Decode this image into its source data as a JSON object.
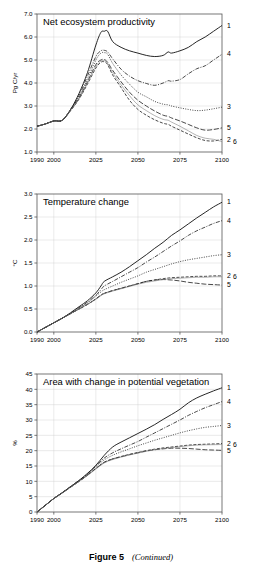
{
  "figure": {
    "caption_label": "Figure 5",
    "caption_note": "(Continued)"
  },
  "axis": {
    "x_ticks": [
      "1990",
      "2000",
      "2025",
      "2050",
      "2075",
      "2100"
    ],
    "x_tick_values": [
      1990,
      2000,
      2025,
      2050,
      2075,
      2100
    ],
    "x_min": 1990,
    "x_max": 2100
  },
  "series_labels": [
    "1",
    "2",
    "3",
    "4",
    "5",
    "6"
  ],
  "chart_data": [
    {
      "type": "line",
      "title": "Net ecosystem productivity",
      "xlabel": "",
      "ylabel": "Pg C/yr",
      "xlim": [
        1990,
        2100
      ],
      "ylim": [
        1.0,
        7.0
      ],
      "grid": true,
      "legend_position": "right-edge-labels",
      "yticks": [
        1.0,
        2.0,
        3.0,
        4.0,
        5.0,
        6.0,
        7.0
      ],
      "ytick_labels": [
        "1.0",
        "2.0",
        "3.0",
        "4.0",
        "5.0",
        "6.0",
        "7.0"
      ],
      "xticks": [
        1990,
        2000,
        2025,
        2050,
        2075,
        2100
      ],
      "xtick_labels": [
        "1990",
        "2000",
        "2025",
        "2050",
        "2075",
        "2100"
      ],
      "x": [
        1990,
        1995,
        2000,
        2005,
        2010,
        2015,
        2020,
        2025,
        2028,
        2030,
        2032,
        2035,
        2040,
        2045,
        2050,
        2055,
        2060,
        2065,
        2068,
        2070,
        2075,
        2080,
        2085,
        2090,
        2095,
        2100
      ],
      "series": [
        {
          "name": "1",
          "label": "1",
          "style": "solid",
          "end_label_value": 6.5,
          "values": [
            2.12,
            2.22,
            2.35,
            2.38,
            2.85,
            3.55,
            4.45,
            5.65,
            6.2,
            6.25,
            6.25,
            5.8,
            5.55,
            5.4,
            5.3,
            5.2,
            5.15,
            5.2,
            5.35,
            5.3,
            5.4,
            5.55,
            5.8,
            6.0,
            6.25,
            6.5
          ]
        },
        {
          "name": "2",
          "label": "2",
          "style": "dashed",
          "end_label_value": 1.55,
          "values": [
            2.12,
            2.22,
            2.35,
            2.38,
            2.8,
            3.3,
            3.95,
            4.65,
            4.9,
            4.92,
            4.8,
            4.35,
            3.8,
            3.25,
            2.85,
            2.6,
            2.4,
            2.25,
            2.2,
            2.12,
            1.95,
            1.78,
            1.62,
            1.5,
            1.48,
            1.55
          ]
        },
        {
          "name": "3",
          "label": "3",
          "style": "dotted",
          "end_label_value": 2.95,
          "values": [
            2.12,
            2.22,
            2.35,
            2.38,
            2.85,
            3.4,
            4.15,
            5.0,
            5.3,
            5.32,
            5.25,
            4.85,
            4.35,
            3.95,
            3.6,
            3.4,
            3.2,
            3.08,
            3.05,
            3.0,
            2.92,
            2.85,
            2.8,
            2.82,
            2.88,
            2.95
          ]
        },
        {
          "name": "4",
          "label": "4",
          "style": "dashdot",
          "end_label_value": 5.25,
          "values": [
            2.12,
            2.22,
            2.35,
            2.38,
            2.85,
            3.45,
            4.3,
            5.15,
            5.4,
            5.42,
            5.35,
            5.05,
            4.6,
            4.3,
            4.1,
            3.98,
            3.9,
            4.0,
            4.1,
            4.08,
            4.15,
            4.4,
            4.62,
            4.75,
            5.0,
            5.25
          ]
        },
        {
          "name": "5",
          "label": "5",
          "style": "longdash",
          "end_label_value": 2.05,
          "values": [
            2.12,
            2.22,
            2.35,
            2.38,
            2.82,
            3.35,
            4.05,
            4.8,
            5.0,
            5.02,
            4.9,
            4.55,
            4.05,
            3.6,
            3.25,
            3.0,
            2.78,
            2.6,
            2.55,
            2.48,
            2.35,
            2.2,
            2.05,
            1.95,
            1.98,
            2.05
          ]
        },
        {
          "name": "6",
          "label": "6",
          "style": "solid-thin",
          "end_label_value": 1.45,
          "values": [
            2.12,
            2.22,
            2.35,
            2.38,
            2.82,
            3.32,
            4.0,
            4.72,
            4.95,
            4.97,
            4.85,
            4.45,
            3.92,
            3.45,
            3.05,
            2.8,
            2.58,
            2.42,
            2.38,
            2.3,
            2.12,
            1.92,
            1.72,
            1.6,
            1.55,
            1.45
          ]
        }
      ]
    },
    {
      "type": "line",
      "title": "Temperature change",
      "xlabel": "",
      "ylabel": "°C",
      "xlim": [
        1990,
        2100
      ],
      "ylim": [
        0.0,
        3.0
      ],
      "grid": true,
      "legend_position": "right-edge-labels",
      "yticks": [
        0.0,
        0.5,
        1.0,
        1.5,
        2.0,
        2.5,
        3.0
      ],
      "ytick_labels": [
        "0.0",
        "0.5",
        "1.0",
        "1.5",
        "2.0",
        "2.5",
        "3.0"
      ],
      "xticks": [
        1990,
        2000,
        2025,
        2050,
        2075,
        2100
      ],
      "xtick_labels": [
        "1990",
        "2000",
        "2025",
        "2050",
        "2075",
        "2100"
      ],
      "x": [
        1990,
        1995,
        2000,
        2005,
        2010,
        2015,
        2020,
        2025,
        2028,
        2030,
        2035,
        2040,
        2045,
        2050,
        2055,
        2060,
        2065,
        2070,
        2075,
        2080,
        2085,
        2090,
        2095,
        2100
      ],
      "series": [
        {
          "name": "1",
          "label": "1",
          "style": "solid",
          "end_label_value": 2.82,
          "values": [
            0.0,
            0.1,
            0.2,
            0.3,
            0.42,
            0.55,
            0.68,
            0.85,
            1.0,
            1.1,
            1.2,
            1.3,
            1.42,
            1.55,
            1.68,
            1.82,
            1.95,
            2.1,
            2.22,
            2.35,
            2.48,
            2.6,
            2.72,
            2.82
          ]
        },
        {
          "name": "2",
          "label": "2",
          "style": "dashed",
          "end_label_value": 1.22,
          "values": [
            0.0,
            0.1,
            0.2,
            0.3,
            0.4,
            0.5,
            0.6,
            0.72,
            0.8,
            0.84,
            0.9,
            0.95,
            1.0,
            1.05,
            1.1,
            1.13,
            1.16,
            1.18,
            1.19,
            1.2,
            1.21,
            1.21,
            1.22,
            1.22
          ]
        },
        {
          "name": "3",
          "label": "3",
          "style": "dotted",
          "end_label_value": 1.68,
          "values": [
            0.0,
            0.1,
            0.2,
            0.3,
            0.4,
            0.52,
            0.63,
            0.78,
            0.87,
            0.92,
            1.0,
            1.08,
            1.15,
            1.22,
            1.3,
            1.36,
            1.42,
            1.48,
            1.53,
            1.57,
            1.6,
            1.63,
            1.66,
            1.68
          ]
        },
        {
          "name": "4",
          "label": "4",
          "style": "dashdot",
          "end_label_value": 2.42,
          "values": [
            0.0,
            0.1,
            0.2,
            0.3,
            0.41,
            0.53,
            0.65,
            0.8,
            0.92,
            1.0,
            1.1,
            1.2,
            1.3,
            1.4,
            1.52,
            1.63,
            1.75,
            1.87,
            1.98,
            2.1,
            2.2,
            2.28,
            2.36,
            2.42
          ]
        },
        {
          "name": "5",
          "label": "5",
          "style": "longdash",
          "end_label_value": 1.02,
          "values": [
            0.0,
            0.1,
            0.2,
            0.3,
            0.4,
            0.5,
            0.6,
            0.72,
            0.8,
            0.84,
            0.9,
            0.95,
            1.0,
            1.05,
            1.1,
            1.13,
            1.14,
            1.13,
            1.11,
            1.08,
            1.06,
            1.04,
            1.03,
            1.02
          ]
        },
        {
          "name": "6",
          "label": "6",
          "style": "solid-thin",
          "end_label_value": 1.2,
          "values": [
            0.0,
            0.1,
            0.2,
            0.3,
            0.4,
            0.5,
            0.6,
            0.71,
            0.79,
            0.83,
            0.89,
            0.94,
            0.99,
            1.04,
            1.08,
            1.11,
            1.14,
            1.16,
            1.17,
            1.18,
            1.19,
            1.19,
            1.2,
            1.2
          ]
        }
      ]
    },
    {
      "type": "line",
      "title": "Area with change in potential vegetation",
      "xlabel": "",
      "ylabel": "%",
      "xlim": [
        1990,
        2100
      ],
      "ylim": [
        0,
        45
      ],
      "grid": true,
      "legend_position": "right-edge-labels",
      "yticks": [
        0,
        5,
        10,
        15,
        20,
        25,
        30,
        35,
        40,
        45
      ],
      "ytick_labels": [
        "0",
        "5",
        "10",
        "15",
        "20",
        "25",
        "30",
        "35",
        "40",
        "45"
      ],
      "xticks": [
        1990,
        2000,
        2025,
        2050,
        2075,
        2100
      ],
      "xtick_labels": [
        "1990",
        "2000",
        "2025",
        "2050",
        "2075",
        "2100"
      ],
      "x": [
        1990,
        1995,
        2000,
        2005,
        2010,
        2015,
        2020,
        2025,
        2030,
        2035,
        2040,
        2045,
        2050,
        2055,
        2060,
        2065,
        2070,
        2075,
        2080,
        2085,
        2090,
        2095,
        2100
      ],
      "series": [
        {
          "name": "1",
          "label": "1",
          "style": "solid",
          "end_label_value": 40.5,
          "values": [
            0.0,
            2.2,
            4.4,
            6.3,
            8.3,
            10.3,
            12.6,
            15.2,
            18.5,
            21.2,
            22.8,
            24.2,
            25.6,
            27.0,
            28.5,
            30.2,
            31.8,
            33.5,
            35.6,
            37.2,
            38.4,
            39.5,
            40.5
          ]
        },
        {
          "name": "2",
          "label": "2",
          "style": "dashed",
          "end_label_value": 22.3,
          "values": [
            0.0,
            2.2,
            4.4,
            6.2,
            8.1,
            10.0,
            12.0,
            14.2,
            16.2,
            17.3,
            18.1,
            18.8,
            19.4,
            20.0,
            20.5,
            20.9,
            21.2,
            21.5,
            21.8,
            22.0,
            22.1,
            22.2,
            22.3
          ]
        },
        {
          "name": "3",
          "label": "3",
          "style": "dotted",
          "end_label_value": 28.2,
          "values": [
            0.0,
            2.2,
            4.4,
            6.3,
            8.2,
            10.2,
            12.3,
            14.8,
            17.0,
            18.5,
            19.6,
            20.6,
            21.6,
            22.5,
            23.4,
            24.2,
            25.0,
            25.8,
            26.5,
            27.1,
            27.6,
            27.9,
            28.2
          ]
        },
        {
          "name": "4",
          "label": "4",
          "style": "dashdot",
          "end_label_value": 36.0,
          "values": [
            0.0,
            2.2,
            4.4,
            6.3,
            8.3,
            10.3,
            12.4,
            15.0,
            17.6,
            19.3,
            20.6,
            21.8,
            23.0,
            24.4,
            25.8,
            27.2,
            28.6,
            30.0,
            31.5,
            32.8,
            34.0,
            35.0,
            36.0
          ]
        },
        {
          "name": "5",
          "label": "5",
          "style": "longdash",
          "end_label_value": 20.1,
          "values": [
            0.0,
            2.2,
            4.4,
            6.2,
            8.1,
            10.0,
            12.0,
            14.2,
            16.2,
            17.3,
            18.0,
            18.7,
            19.3,
            19.9,
            20.3,
            20.6,
            20.8,
            20.8,
            20.7,
            20.5,
            20.3,
            20.2,
            20.1
          ]
        },
        {
          "name": "6",
          "label": "6",
          "style": "solid-thin",
          "end_label_value": 22.0,
          "values": [
            0.0,
            2.2,
            4.4,
            6.2,
            8.1,
            10.0,
            11.9,
            14.0,
            16.0,
            17.1,
            17.9,
            18.6,
            19.2,
            19.8,
            20.3,
            20.7,
            21.0,
            21.3,
            21.6,
            21.8,
            21.9,
            21.95,
            22.0
          ]
        }
      ]
    }
  ]
}
